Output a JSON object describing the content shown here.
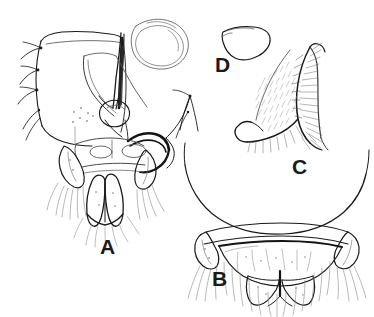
{
  "figure": {
    "kind": "scientific-line-drawing",
    "background_color": "#ffffff",
    "ink_color": "#1a1a1a",
    "shading_color": "#8a8a8a",
    "width": 374,
    "height": 317,
    "panels": [
      {
        "id": "A",
        "label": "A",
        "caption": "A",
        "view": "epandrium and phallic complex, caudal view",
        "label_x": 100,
        "label_y": 236
      },
      {
        "id": "B",
        "label": "B",
        "caption": "B",
        "view": "hypopygium with cerci and surstyli, ventral view",
        "label_x": 212,
        "label_y": 268
      },
      {
        "id": "C",
        "label": "C",
        "caption": "C",
        "view": "gonostylus with dense marginal microtrichia, lateral view",
        "label_x": 292,
        "label_y": 156
      },
      {
        "id": "D",
        "label": "D",
        "caption": "D",
        "view": "small quadrangular sclerite outline",
        "label_x": 215,
        "label_y": 54
      }
    ]
  }
}
